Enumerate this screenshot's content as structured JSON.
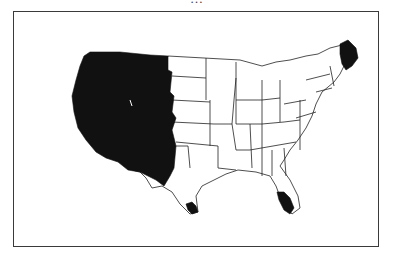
{
  "caption": {
    "text": "…"
  },
  "map": {
    "region": "Contiguous United States",
    "style": "black-and-white shaded state outline map",
    "fill_color": "#111111",
    "outline_color": "#222222",
    "background_color": "#ffffff",
    "shaded_regions": [
      "Western region (Pacific coast through Rocky Mountain states, irregular eastern edge)",
      "Maine",
      "Southern Florida",
      "Southern tip of Texas"
    ],
    "unshaded_regions": "Rest of the contiguous states shown with white fill and thin black borders"
  }
}
